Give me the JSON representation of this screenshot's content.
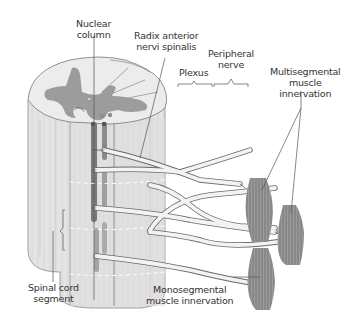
{
  "labels": {
    "nuclear_column": [
      "Nuclear",
      "column"
    ],
    "radix": [
      "Radix anterior",
      "nervi spinalis"
    ],
    "plexus": "Plexus",
    "peripheral_nerve": [
      "Peripheral",
      "nerve"
    ],
    "multisegmental": [
      "Multisegmental",
      "muscle",
      "innervation"
    ],
    "spinal_segment": [
      "Spinal cord",
      "segment"
    ],
    "monosegmental": [
      "Monosegmental",
      "muscle innervation"
    ]
  },
  "colors": {
    "white_matter": "#e6e6e6",
    "white_matter_light": "#efefef",
    "gray_matter": "#9a9a9a",
    "column_dark": "#7d7d7d",
    "nerve_fill": "#f2f2f2",
    "nerve_stroke": "#6a6a6a",
    "muscle": "#8c8c8c",
    "leader": "#555555",
    "text": "#333333"
  }
}
